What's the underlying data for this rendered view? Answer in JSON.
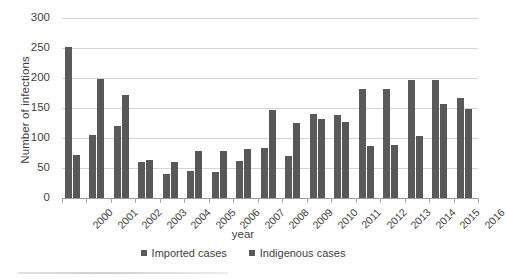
{
  "chart_data": {
    "type": "bar",
    "title": "",
    "xlabel": "year",
    "ylabel": "Number of infections",
    "ylim": [
      0,
      300
    ],
    "yticks": [
      0,
      50,
      100,
      150,
      200,
      250,
      300
    ],
    "grid": true,
    "legend_position": "bottom",
    "categories": [
      "2000",
      "2001",
      "2002",
      "2003",
      "2004",
      "2005",
      "2006",
      "2007",
      "2008",
      "2009",
      "2010",
      "2011",
      "2012",
      "2013",
      "2014",
      "2015",
      "2016"
    ],
    "series": [
      {
        "name": "Imported cases",
        "color": "#5a5a5a",
        "values": [
          252,
          105,
          120,
          60,
          40,
          45,
          44,
          62,
          83,
          70,
          140,
          139,
          182,
          182,
          197,
          196,
          167
        ]
      },
      {
        "name": "Indigenous cases",
        "color": "#575757",
        "values": [
          72,
          198,
          171,
          64,
          60,
          79,
          79,
          82,
          146,
          125,
          131,
          126,
          87,
          88,
          103,
          156,
          148
        ]
      }
    ]
  },
  "axes": {
    "y_title": "Number of infections",
    "x_title": "year"
  }
}
